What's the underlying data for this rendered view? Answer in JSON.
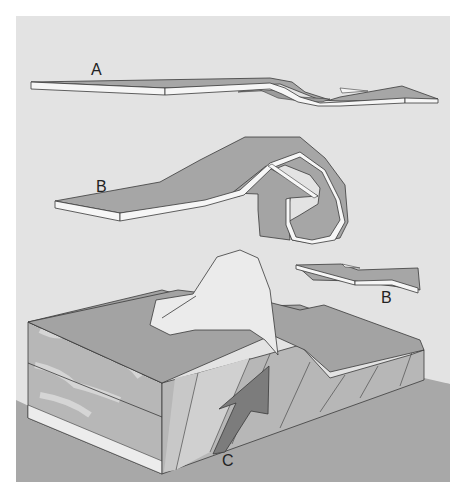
{
  "figure": {
    "labels": {
      "a": "A",
      "b_upper": "B",
      "b_lower": "B",
      "c": "C"
    }
  },
  "colors": {
    "page_bg": "#ffffff",
    "panel_bg": "#e4e4e4",
    "ground": "#a9a9a9",
    "layer_top": "#a5a5a5",
    "layer_edge": "#f6f6f6",
    "outline": "#3a3a3a",
    "block_face": "#b5b5b5",
    "block_mottle": "#dcdcdc",
    "arrow_c": "#7a7a7a",
    "blob": "#e9e9e9"
  }
}
